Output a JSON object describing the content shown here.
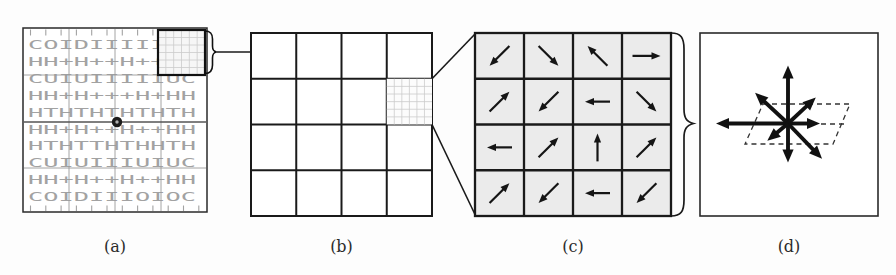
{
  "figure": {
    "caption_labels": [
      "(a)",
      "(b)",
      "(c)",
      "(d)"
    ]
  },
  "colors": {
    "ink": "#1a1a1a",
    "texture_gray": "#a2a2a2",
    "block_line_gray": "#9a9a9a",
    "mid_line_gray": "#555555",
    "cell_fill": "#ebebeb",
    "fine_grid": "#cccccc",
    "dashed_line": "#333333",
    "background": "#fdfdfd"
  },
  "panel_a": {
    "texture_rows": [
      "COIDIIIIIOC",
      "HH+H++H++HH",
      "CUIUIIIIIUC",
      "HH+H+++H+HH",
      "HTHTHTHTHTH",
      "HH+H++H++HH",
      "HTHTTHTHHTH",
      "CUIUIIIUIUC",
      "HH+H++H++HH",
      "COIDIIIOIOC"
    ],
    "keypoint": {
      "cx": 117,
      "cy": 122
    },
    "zoom_window": {
      "x": 158,
      "y": 30,
      "w": 47,
      "h": 45
    }
  },
  "panel_b": {
    "rows": 4,
    "cols": 4,
    "highlight_cell": {
      "row": 2,
      "col": 4
    }
  },
  "panel_c": {
    "rows": 4,
    "cols": 4,
    "arrow_angles_deg": [
      [
        225,
        315,
        135,
        0
      ],
      [
        45,
        225,
        180,
        315
      ],
      [
        180,
        45,
        90,
        45
      ],
      [
        45,
        225,
        180,
        225
      ]
    ],
    "arrow_length": 28
  },
  "panel_d": {
    "histogram_center": {
      "cx": 788,
      "cy": 123.5
    },
    "histogram_arrows": [
      {
        "angle_deg": 90,
        "length": 58
      },
      {
        "angle_deg": 137,
        "length": 45
      },
      {
        "angle_deg": 180,
        "length": 72
      },
      {
        "angle_deg": 43,
        "length": 38
      },
      {
        "angle_deg": 0,
        "length": 32
      },
      {
        "angle_deg": -46,
        "length": 49
      },
      {
        "angle_deg": -90,
        "length": 39
      },
      {
        "angle_deg": -140,
        "length": 27
      }
    ],
    "dashed_plane_points": "763,104 850,104 833,144 745,144",
    "dashed_mid_segment": {
      "x1": 821,
      "y1": 124,
      "x2": 844,
      "y2": 124
    }
  }
}
